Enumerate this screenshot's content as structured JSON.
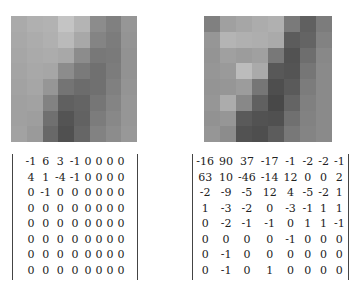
{
  "figure": {
    "panels": [
      {
        "name": "left",
        "image_gray": [
          [
            170,
            176,
            178,
            196,
            180,
            140,
            128,
            150
          ],
          [
            168,
            172,
            176,
            186,
            168,
            132,
            124,
            148
          ],
          [
            166,
            170,
            172,
            168,
            140,
            120,
            122,
            146
          ],
          [
            164,
            168,
            166,
            140,
            122,
            112,
            124,
            146
          ],
          [
            162,
            166,
            150,
            116,
            108,
            112,
            128,
            148
          ],
          [
            160,
            162,
            130,
            96,
            100,
            118,
            132,
            150
          ],
          [
            160,
            158,
            112,
            84,
            98,
            124,
            136,
            150
          ],
          [
            162,
            154,
            104,
            80,
            102,
            130,
            140,
            152
          ]
        ],
        "coefficients": [
          [
            "-1",
            "6",
            "3",
            "-1",
            "0",
            "0",
            "0",
            "0"
          ],
          [
            "4",
            "1",
            "-4",
            "-1",
            "0",
            "0",
            "0",
            "0"
          ],
          [
            "0",
            "-1",
            "0",
            "0",
            "0",
            "0",
            "0",
            "0"
          ],
          [
            "0",
            "0",
            "0",
            "0",
            "0",
            "0",
            "0",
            "0"
          ],
          [
            "0",
            "0",
            "0",
            "0",
            "0",
            "0",
            "0",
            "0"
          ],
          [
            "0",
            "0",
            "0",
            "0",
            "0",
            "0",
            "0",
            "0"
          ],
          [
            "0",
            "0",
            "0",
            "0",
            "0",
            "0",
            "0",
            "0"
          ],
          [
            "0",
            "0",
            "0",
            "0",
            "0",
            "0",
            "0",
            "0"
          ]
        ]
      },
      {
        "name": "right",
        "image_gray": [
          [
            128,
            160,
            166,
            172,
            176,
            122,
            96,
            124
          ],
          [
            150,
            180,
            176,
            174,
            170,
            92,
            100,
            130
          ],
          [
            148,
            160,
            156,
            160,
            120,
            82,
            110,
            136
          ],
          [
            150,
            154,
            188,
            170,
            88,
            84,
            118,
            138
          ],
          [
            148,
            150,
            156,
            118,
            78,
            90,
            124,
            138
          ],
          [
            150,
            172,
            136,
            96,
            72,
            100,
            128,
            138
          ],
          [
            146,
            150,
            90,
            82,
            80,
            112,
            130,
            138
          ],
          [
            150,
            140,
            82,
            78,
            92,
            120,
            132,
            138
          ]
        ],
        "coefficients": [
          [
            "-16",
            "90",
            "37",
            "-17",
            "-1",
            "-2",
            "-2",
            "-1"
          ],
          [
            "63",
            "10",
            "-46",
            "-14",
            "12",
            "0",
            "0",
            "2"
          ],
          [
            "-2",
            "-9",
            "-5",
            "12",
            "4",
            "-5",
            "-2",
            "1"
          ],
          [
            "1",
            "-3",
            "-2",
            "0",
            "-3",
            "-1",
            "1",
            "1"
          ],
          [
            "0",
            "-2",
            "-1",
            "-1",
            "0",
            "1",
            "1",
            "-1"
          ],
          [
            "0",
            "0",
            "0",
            "0",
            "-1",
            "0",
            "0",
            "0"
          ],
          [
            "0",
            "-1",
            "0",
            "0",
            "0",
            "0",
            "0",
            "0"
          ],
          [
            "0",
            "-1",
            "0",
            "1",
            "0",
            "0",
            "0",
            "0"
          ]
        ]
      }
    ]
  }
}
